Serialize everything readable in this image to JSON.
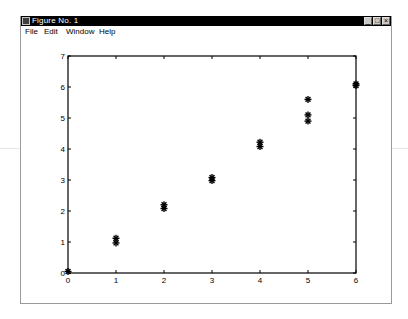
{
  "window": {
    "title": "Figure No. 1",
    "controls": [
      "minimize",
      "maximize",
      "close"
    ]
  },
  "menubar": {
    "items": [
      {
        "label": "File"
      },
      {
        "label": "Edit"
      },
      {
        "label": "Window"
      },
      {
        "label": "Help"
      }
    ]
  },
  "chart_data": {
    "type": "scatter",
    "title": "",
    "xlabel": "",
    "ylabel": "",
    "xlim": [
      0,
      6
    ],
    "ylim": [
      0,
      7
    ],
    "xticks": [
      0,
      1,
      2,
      3,
      4,
      5,
      6
    ],
    "yticks": [
      0,
      1,
      2,
      3,
      4,
      5,
      6,
      7
    ],
    "grid": false,
    "legend": null,
    "marker": "*",
    "marker_color": "#000000",
    "series": [
      {
        "name": "data",
        "points": [
          {
            "x": 0,
            "y": 0.05
          },
          {
            "x": 1,
            "y": 1.12
          },
          {
            "x": 1,
            "y": 0.97
          },
          {
            "x": 2,
            "y": 2.2
          },
          {
            "x": 2,
            "y": 2.08
          },
          {
            "x": 3,
            "y": 3.08
          },
          {
            "x": 3,
            "y": 2.98
          },
          {
            "x": 4,
            "y": 4.22
          },
          {
            "x": 4,
            "y": 4.08
          },
          {
            "x": 5,
            "y": 5.6
          },
          {
            "x": 5,
            "y": 5.1
          },
          {
            "x": 5,
            "y": 4.9
          },
          {
            "x": 6,
            "y": 6.1
          },
          {
            "x": 6,
            "y": 6.05
          }
        ]
      }
    ]
  }
}
